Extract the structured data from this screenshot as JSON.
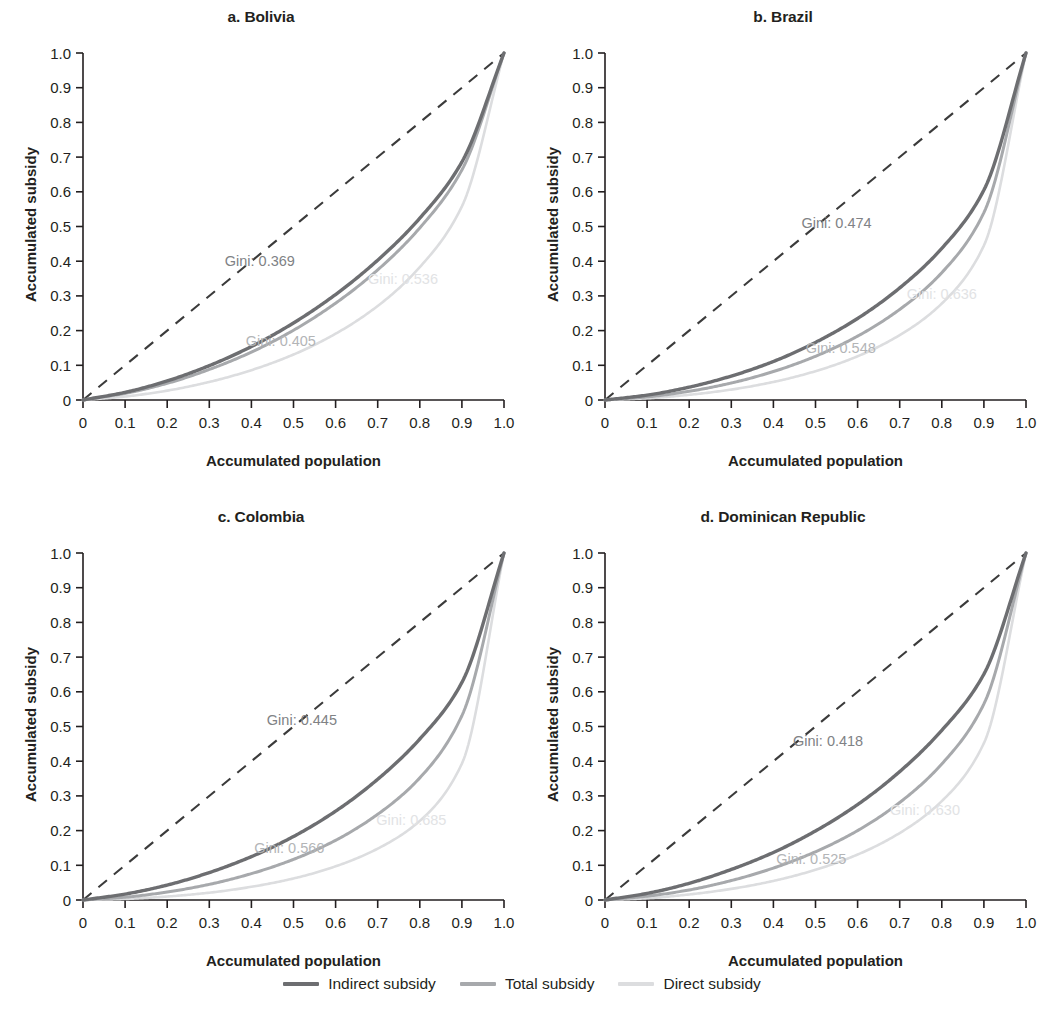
{
  "figure": {
    "axis_x_label": "Accumulated population",
    "axis_y_label": "Accumulated subsidy",
    "x_ticks": [
      "0",
      "0.1",
      "0.2",
      "0.3",
      "0.4",
      "0.5",
      "0.6",
      "0.7",
      "0.8",
      "0.9",
      "1.0"
    ],
    "y_ticks": [
      "0",
      "0.1",
      "0.2",
      "0.3",
      "0.4",
      "0.5",
      "0.6",
      "0.7",
      "0.8",
      "0.9",
      "1.0"
    ]
  },
  "legend": {
    "items": [
      {
        "label": "Indirect subsidy",
        "color": "#6d6e71"
      },
      {
        "label": "Total subsidy",
        "color": "#a7a9ac"
      },
      {
        "label": "Direct subsidy",
        "color": "#dcdddf"
      }
    ]
  },
  "colors": {
    "indirect": "#6d6e71",
    "total": "#a7a9ac",
    "direct": "#dcdddf",
    "equality": "#3b3b3b",
    "axis": "#231f20",
    "gini_indirect": "#808285",
    "gini_total": "#b3b5b7",
    "gini_direct": "#e2e3e5"
  },
  "chart_data": [
    {
      "type": "line",
      "title": "a. Bolivia",
      "xlabel": "Accumulated population",
      "ylabel": "Accumulated subsidy",
      "xlim": [
        0,
        1
      ],
      "ylim": [
        0,
        1
      ],
      "grid": false,
      "legend_position": "bottom",
      "x": [
        0,
        0.1,
        0.2,
        0.3,
        0.4,
        0.5,
        0.6,
        0.7,
        0.8,
        0.9,
        1.0
      ],
      "series": [
        {
          "name": "Indirect subsidy",
          "gini": 0.369,
          "gini_label": "Gini: 0.369",
          "gini_label_x": 0.42,
          "gini_label_y": 0.385,
          "color": "#6d6e71",
          "values": [
            0.0,
            0.022,
            0.055,
            0.099,
            0.154,
            0.222,
            0.304,
            0.403,
            0.524,
            0.686,
            1.0
          ]
        },
        {
          "name": "Total subsidy",
          "gini": 0.405,
          "gini_label": "Gini: 0.405",
          "gini_label_x": 0.47,
          "gini_label_y": 0.155,
          "color": "#a7a9ac",
          "values": [
            0.0,
            0.019,
            0.048,
            0.088,
            0.138,
            0.201,
            0.279,
            0.375,
            0.496,
            0.663,
            1.0
          ]
        },
        {
          "name": "Direct subsidy",
          "gini": 0.536,
          "gini_label": "Gini: 0.536",
          "gini_label_x": 0.76,
          "gini_label_y": 0.335,
          "color": "#dcdddf",
          "values": [
            0.0,
            0.01,
            0.027,
            0.052,
            0.086,
            0.131,
            0.191,
            0.271,
            0.383,
            0.558,
            1.0
          ]
        },
        {
          "name": "Line of equality",
          "gini": 0.0,
          "color": "#3b3b3b",
          "dashed": true,
          "values": [
            0.0,
            0.1,
            0.2,
            0.3,
            0.4,
            0.5,
            0.6,
            0.7,
            0.8,
            0.9,
            1.0
          ]
        }
      ]
    },
    {
      "type": "line",
      "title": "b. Brazil",
      "xlabel": "Accumulated population",
      "ylabel": "Accumulated subsidy",
      "xlim": [
        0,
        1
      ],
      "ylim": [
        0,
        1
      ],
      "grid": false,
      "legend_position": "bottom",
      "x": [
        0,
        0.1,
        0.2,
        0.3,
        0.4,
        0.5,
        0.6,
        0.7,
        0.8,
        0.9,
        1.0
      ],
      "series": [
        {
          "name": "Indirect subsidy",
          "gini": 0.474,
          "gini_label": "Gini: 0.474",
          "gini_label_x": 0.55,
          "gini_label_y": 0.495,
          "color": "#6d6e71",
          "values": [
            0.0,
            0.014,
            0.037,
            0.069,
            0.111,
            0.166,
            0.235,
            0.323,
            0.437,
            0.605,
            1.0
          ]
        },
        {
          "name": "Total subsidy",
          "gini": 0.548,
          "gini_label": "Gini: 0.548",
          "gini_label_x": 0.56,
          "gini_label_y": 0.135,
          "color": "#a7a9ac",
          "values": [
            0.0,
            0.009,
            0.025,
            0.049,
            0.082,
            0.126,
            0.184,
            0.261,
            0.367,
            0.54,
            1.0
          ]
        },
        {
          "name": "Direct subsidy",
          "gini": 0.636,
          "gini_label": "Gini: 0.636",
          "gini_label_x": 0.8,
          "gini_label_y": 0.29,
          "color": "#dcdddf",
          "values": [
            0.0,
            0.005,
            0.015,
            0.03,
            0.052,
            0.083,
            0.126,
            0.187,
            0.278,
            0.445,
            1.0
          ]
        },
        {
          "name": "Line of equality",
          "gini": 0.0,
          "color": "#3b3b3b",
          "dashed": true,
          "values": [
            0.0,
            0.1,
            0.2,
            0.3,
            0.4,
            0.5,
            0.6,
            0.7,
            0.8,
            0.9,
            1.0
          ]
        }
      ]
    },
    {
      "type": "line",
      "title": "c. Colombia",
      "xlabel": "Accumulated population",
      "ylabel": "Accumulated subsidy",
      "xlim": [
        0,
        1
      ],
      "ylim": [
        0,
        1
      ],
      "grid": false,
      "legend_position": "bottom",
      "x": [
        0,
        0.1,
        0.2,
        0.3,
        0.4,
        0.5,
        0.6,
        0.7,
        0.8,
        0.9,
        1.0
      ],
      "series": [
        {
          "name": "Indirect subsidy",
          "gini": 0.445,
          "gini_label": "Gini: 0.445",
          "gini_label_x": 0.52,
          "gini_label_y": 0.505,
          "color": "#6d6e71",
          "values": [
            0.0,
            0.017,
            0.043,
            0.079,
            0.125,
            0.183,
            0.256,
            0.348,
            0.464,
            0.627,
            1.0
          ]
        },
        {
          "name": "Total subsidy",
          "gini": 0.566,
          "gini_label": "Gini: 0.566",
          "gini_label_x": 0.49,
          "gini_label_y": 0.135,
          "color": "#a7a9ac",
          "values": [
            0.0,
            0.008,
            0.023,
            0.045,
            0.076,
            0.117,
            0.172,
            0.247,
            0.352,
            0.531,
            1.0
          ]
        },
        {
          "name": "Direct subsidy",
          "gini": 0.685,
          "gini_label": "Gini: 0.685",
          "gini_label_x": 0.78,
          "gini_label_y": 0.215,
          "color": "#dcdddf",
          "values": [
            0.0,
            0.003,
            0.01,
            0.021,
            0.038,
            0.062,
            0.097,
            0.148,
            0.228,
            0.393,
            1.0
          ]
        },
        {
          "name": "Line of equality",
          "gini": 0.0,
          "color": "#3b3b3b",
          "dashed": true,
          "values": [
            0.0,
            0.1,
            0.2,
            0.3,
            0.4,
            0.5,
            0.6,
            0.7,
            0.8,
            0.9,
            1.0
          ]
        }
      ]
    },
    {
      "type": "line",
      "title": "d. Dominican Republic",
      "xlabel": "Accumulated population",
      "ylabel": "Accumulated subsidy",
      "xlim": [
        0,
        1
      ],
      "ylim": [
        0,
        1
      ],
      "grid": false,
      "legend_position": "bottom",
      "x": [
        0,
        0.1,
        0.2,
        0.3,
        0.4,
        0.5,
        0.6,
        0.7,
        0.8,
        0.9,
        1.0
      ],
      "series": [
        {
          "name": "Indirect subsidy",
          "gini": 0.418,
          "gini_label": "Gini: 0.418",
          "gini_label_x": 0.53,
          "gini_label_y": 0.445,
          "color": "#6d6e71",
          "values": [
            0.0,
            0.019,
            0.048,
            0.088,
            0.137,
            0.199,
            0.275,
            0.37,
            0.489,
            0.651,
            1.0
          ]
        },
        {
          "name": "Total subsidy",
          "gini": 0.525,
          "gini_label": "Gini: 0.525",
          "gini_label_x": 0.49,
          "gini_label_y": 0.105,
          "color": "#a7a9ac",
          "values": [
            0.0,
            0.011,
            0.029,
            0.056,
            0.092,
            0.139,
            0.2,
            0.281,
            0.392,
            0.565,
            1.0
          ]
        },
        {
          "name": "Direct subsidy",
          "gini": 0.63,
          "gini_label": "Gini: 0.630",
          "gini_label_x": 0.76,
          "gini_label_y": 0.245,
          "color": "#dcdddf",
          "values": [
            0.0,
            0.005,
            0.016,
            0.032,
            0.055,
            0.087,
            0.131,
            0.193,
            0.285,
            0.452,
            1.0
          ]
        },
        {
          "name": "Line of equality",
          "gini": 0.0,
          "color": "#3b3b3b",
          "dashed": true,
          "values": [
            0.0,
            0.1,
            0.2,
            0.3,
            0.4,
            0.5,
            0.6,
            0.7,
            0.8,
            0.9,
            1.0
          ]
        }
      ]
    }
  ]
}
